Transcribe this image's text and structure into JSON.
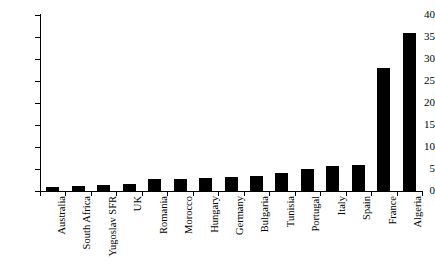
{
  "chart_data": {
    "type": "bar",
    "title": "",
    "subtitle": "",
    "xlabel": "",
    "ylabel": "",
    "ylim": [
      0,
      40
    ],
    "yticks": [
      0,
      5,
      10,
      15,
      20,
      25,
      30,
      35,
      40
    ],
    "grid": false,
    "legend": false,
    "bar_color": "#000000",
    "axis_color": "#000000",
    "categories": [
      "Australia",
      "South Africa",
      "Yugoslav SFR",
      "UK",
      "Romania",
      "Morocco",
      "Hungary",
      "Germany",
      "Bulgaria",
      "Tunisia",
      "Portugal",
      "Italy",
      "Spain",
      "France",
      "Algeria"
    ],
    "values": [
      1.0,
      1.2,
      1.3,
      1.5,
      2.7,
      2.8,
      2.9,
      3.1,
      3.4,
      4.2,
      5.0,
      5.6,
      6.0,
      28.0,
      36.0
    ],
    "series": [
      {
        "name": "",
        "values": [
          1.0,
          1.2,
          1.3,
          1.5,
          2.7,
          2.8,
          2.9,
          3.1,
          3.4,
          4.2,
          5.0,
          5.6,
          6.0,
          28.0,
          36.0
        ]
      }
    ]
  }
}
